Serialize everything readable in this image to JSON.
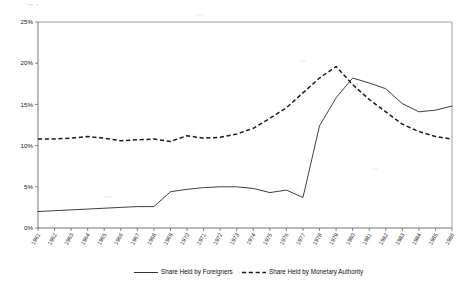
{
  "chart_data": {
    "type": "line",
    "title": "",
    "xlabel": "",
    "ylabel": "",
    "ylim": [
      0,
      25
    ],
    "yunit": "%",
    "grid": false,
    "legend_position": "bottom",
    "categories": [
      "1961",
      "1962",
      "1963",
      "1964",
      "1965",
      "1966",
      "1967",
      "1968",
      "1969",
      "1970",
      "1971",
      "1972",
      "1973",
      "1974",
      "1975",
      "1976",
      "1977",
      "1978",
      "1979",
      "1980",
      "1981",
      "1982",
      "1983",
      "1984",
      "1985",
      "1986"
    ],
    "series": [
      {
        "name": "Share Held by Foreigners",
        "style": "solid",
        "color": "#1c1c1c",
        "values": [
          2.0,
          2.1,
          2.2,
          2.3,
          2.4,
          2.5,
          2.6,
          2.6,
          4.4,
          4.7,
          4.9,
          5.0,
          5.0,
          4.8,
          4.3,
          4.6,
          3.7,
          12.4,
          15.8,
          16.3,
          15.4,
          15.2,
          21.7,
          18.4,
          17.3,
          16.3
        ]
      },
      {
        "name": "Share Held by Monetary Authority",
        "style": "dashed",
        "color": "#1c1c1c",
        "values": [
          10.8,
          10.8,
          10.9,
          11.1,
          10.9,
          10.6,
          10.7,
          10.8,
          10.5,
          11.2,
          10.9,
          11.0,
          11.4,
          12.1,
          13.3,
          14.6,
          16.4,
          18.2,
          19.6,
          21.1,
          21.6,
          21.4,
          23.1,
          23.5,
          22.0,
          19.3
        ]
      }
    ],
    "yticks": [
      "0%",
      "5%",
      "10%",
      "15%",
      "20%",
      "25%"
    ],
    "ytick_values": [
      0,
      5,
      10,
      15,
      20,
      25
    ],
    "note": "Solid series continues declining after peak; dashed series declines to about 10.8 by final year."
  },
  "chart_extra": {
    "solid_tail": [
      18.2,
      17.6,
      16.9,
      15.1,
      14.1,
      14.3,
      14.8
    ],
    "dashed_tail": [
      17.4,
      15.6,
      14.1,
      12.6,
      11.7,
      11.1,
      10.8
    ]
  },
  "legend": {
    "entries": [
      {
        "label": "Share Held by Foreigners",
        "style": "solid"
      },
      {
        "label": "Share Held by Monetary Authority",
        "style": "dashed"
      }
    ]
  },
  "axis": {
    "y_labels": [
      "25%",
      "20%",
      "15%",
      "10%",
      "5%",
      "0%"
    ]
  }
}
